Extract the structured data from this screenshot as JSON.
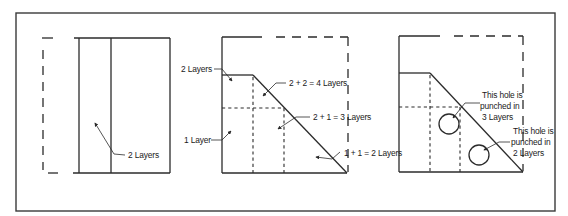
{
  "figure": {
    "panels": [
      {
        "id": "panel-1",
        "labels": [
          {
            "key": "two_layers",
            "text": "2 Layers"
          }
        ]
      },
      {
        "id": "panel-2",
        "labels": [
          {
            "key": "two_layers",
            "text": "2 Layers"
          },
          {
            "key": "one_layer",
            "text": "1 Layer"
          },
          {
            "key": "sum_4",
            "text": "2 + 2 = 4 Layers"
          },
          {
            "key": "sum_3",
            "text": "2 + 1 = 3 Layers"
          },
          {
            "key": "sum_2",
            "text": "1 + 1 = 2 Layers"
          }
        ]
      },
      {
        "id": "panel-3",
        "labels": [
          {
            "key": "hole_3_line1",
            "text": "This hole is"
          },
          {
            "key": "hole_3_line2",
            "text": "punched in"
          },
          {
            "key": "hole_3_line3",
            "text": "3 Layers"
          },
          {
            "key": "hole_2_line1",
            "text": "This hole is"
          },
          {
            "key": "hole_2_line2",
            "text": "punched in"
          },
          {
            "key": "hole_2_line3",
            "text": "2 Layers"
          }
        ],
        "holes": [
          {
            "layers": 3
          },
          {
            "layers": 2
          }
        ]
      }
    ],
    "colors": {
      "line": "#2b2b2b",
      "background": "#ffffff"
    }
  }
}
